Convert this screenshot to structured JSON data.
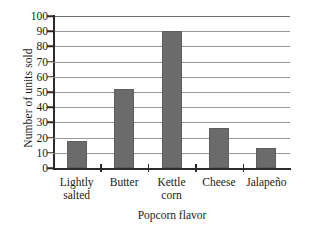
{
  "chart_data": {
    "type": "bar",
    "title": "",
    "xlabel": "Popcorn flavor",
    "ylabel": "Number of units sold",
    "categories": [
      "Lightly\nsalted",
      "Butter",
      "Kettle\ncorn",
      "Cheese",
      "Jalapeño"
    ],
    "values": [
      18,
      52,
      90,
      26,
      13
    ],
    "ylim": [
      0,
      100
    ],
    "yticks": [
      0,
      10,
      20,
      30,
      40,
      50,
      60,
      70,
      80,
      90,
      100
    ],
    "ytick_labels": [
      "0",
      "10",
      "20",
      "30",
      "40",
      "50",
      "60",
      "70",
      "80",
      "90",
      "100"
    ],
    "grid": true,
    "legend": false,
    "bar_color": "#6b6b6b",
    "axis_color": "#2b2b2b",
    "gridline_color": "#9a9a9a",
    "background_color": "#ffffff"
  }
}
